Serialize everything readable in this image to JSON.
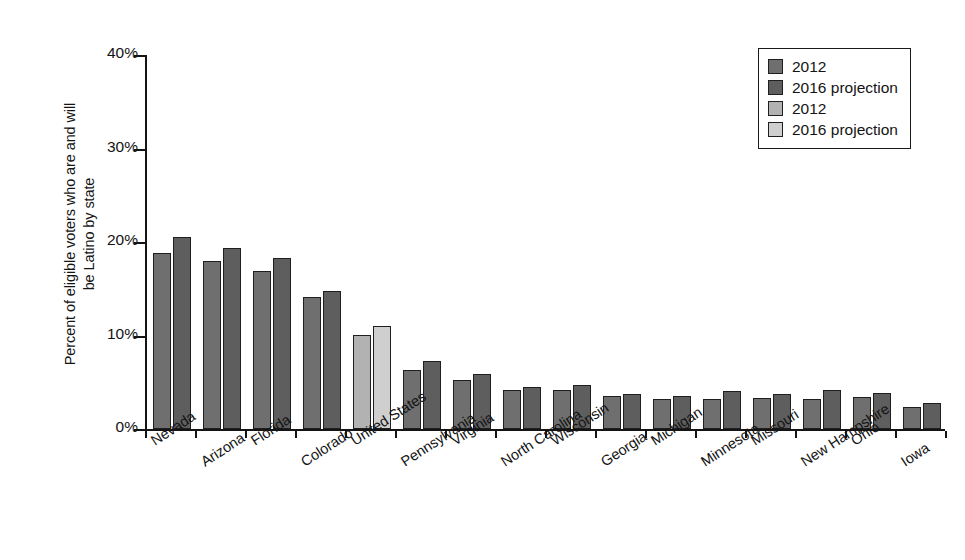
{
  "chart_data": {
    "type": "bar",
    "title": "",
    "subtitle": "",
    "xlabel": "",
    "ylabel": "Percent of eligible voters who are and will\nbe Latino by state",
    "ylim": [
      0,
      40
    ],
    "ytick_labels": [
      "0%",
      "10%",
      "20%",
      "30%",
      "40%"
    ],
    "ytick_values": [
      0,
      10,
      20,
      30,
      40
    ],
    "grid": false,
    "legend_position": "top-right",
    "value_suffix": "%",
    "categories": [
      "Nevada",
      "Arizona",
      "Florida",
      "Colorado",
      "United States",
      "Pennsylvania",
      "Virginia",
      "North Carolina",
      "Wisconsin",
      "Georgia",
      "Michigan",
      "Minnesota",
      "Missouri",
      "New Hampshire",
      "Ohio",
      "Iowa"
    ],
    "highlight_category": "United States",
    "series": [
      {
        "name": "2012",
        "color": "#6f6f6f",
        "values": [
          18.8,
          18.0,
          16.9,
          14.1,
          10.1,
          6.3,
          5.2,
          4.2,
          4.2,
          3.5,
          3.2,
          3.2,
          3.3,
          3.2,
          3.4,
          2.4
        ]
      },
      {
        "name": "2016 projection",
        "color": "#5e5e5e",
        "values": [
          20.5,
          19.4,
          18.3,
          14.8,
          11.0,
          7.3,
          5.9,
          4.5,
          4.7,
          3.7,
          3.5,
          4.1,
          3.7,
          4.2,
          3.9,
          2.8
        ]
      }
    ],
    "highlight_series": [
      {
        "name": "2012",
        "color": "#b2b2b2"
      },
      {
        "name": "2016 projection",
        "color": "#cfcfcf"
      }
    ]
  },
  "legend": {
    "entries": [
      {
        "label": "2012",
        "color": "#6f6f6f"
      },
      {
        "label": "2016 projection",
        "color": "#5e5e5e"
      },
      {
        "label": "2012",
        "color": "#b2b2b2"
      },
      {
        "label": "2016 projection",
        "color": "#cfcfcf"
      }
    ]
  }
}
